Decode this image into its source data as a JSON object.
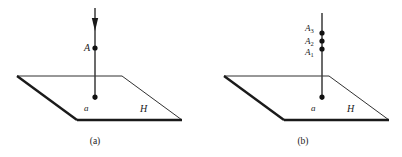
{
  "figure": {
    "background_color": "#ffffff",
    "stroke_color": "#1a1a1a",
    "panels": [
      {
        "id": "panel-a",
        "caption": "(a)",
        "caption_x": 95,
        "caption_y": 144,
        "plane": {
          "label": "H",
          "label_x": 140,
          "label_y": 112,
          "points": "17,76 122,76 182,120 77,120",
          "thin_edges": [
            {
              "x1": 17,
              "y1": 76,
              "x2": 122,
              "y2": 76
            },
            {
              "x1": 122,
              "y1": 76,
              "x2": 182,
              "y2": 120
            }
          ],
          "thick_edges": [
            {
              "x1": 17,
              "y1": 76,
              "x2": 77,
              "y2": 120
            },
            {
              "x1": 77,
              "y1": 120,
              "x2": 182,
              "y2": 120
            }
          ]
        },
        "vertical_line": {
          "x": 95,
          "y_top": 8,
          "y_bottom": 100
        },
        "arrowhead": {
          "x": 95,
          "y_tip": 31,
          "y_base": 18,
          "half_width": 3.2,
          "present": true
        },
        "points": [
          {
            "name": "A",
            "label": "A",
            "subscript": "",
            "x": 95,
            "y": 48,
            "label_x": 84,
            "label_y": 51,
            "radius": 2.6
          },
          {
            "name": "a",
            "label": "a",
            "subscript": "",
            "x": 95,
            "y": 97,
            "label_x": 84,
            "label_y": 111,
            "radius": 2.6
          }
        ]
      },
      {
        "id": "panel-b",
        "caption": "(b)",
        "caption_x": 303,
        "caption_y": 144,
        "plane": {
          "label": "H",
          "label_x": 347,
          "label_y": 112,
          "points": "224,76 329,76 389,120 284,120",
          "thin_edges": [
            {
              "x1": 224,
              "y1": 76,
              "x2": 329,
              "y2": 76
            },
            {
              "x1": 329,
              "y1": 76,
              "x2": 389,
              "y2": 120
            }
          ],
          "thick_edges": [
            {
              "x1": 224,
              "y1": 76,
              "x2": 284,
              "y2": 120
            },
            {
              "x1": 284,
              "y1": 120,
              "x2": 389,
              "y2": 120
            }
          ]
        },
        "vertical_line": {
          "x": 322,
          "y_top": 13,
          "y_bottom": 100
        },
        "arrowhead": {
          "x": 322,
          "y_tip": 0,
          "y_base": 0,
          "half_width": 0,
          "present": false
        },
        "points": [
          {
            "name": "A3",
            "label": "A",
            "subscript": "3",
            "x": 322,
            "y": 33,
            "label_x": 305,
            "label_y": 31,
            "radius": 2.6
          },
          {
            "name": "A2",
            "label": "A",
            "subscript": "2",
            "x": 322,
            "y": 41,
            "label_x": 305,
            "label_y": 44,
            "radius": 2.6
          },
          {
            "name": "A1",
            "label": "A",
            "subscript": "1",
            "x": 322,
            "y": 49,
            "label_x": 305,
            "label_y": 55,
            "radius": 2.6
          },
          {
            "name": "a",
            "label": "a",
            "subscript": "",
            "x": 322,
            "y": 97,
            "label_x": 311,
            "label_y": 111,
            "radius": 2.6
          }
        ]
      }
    ]
  }
}
